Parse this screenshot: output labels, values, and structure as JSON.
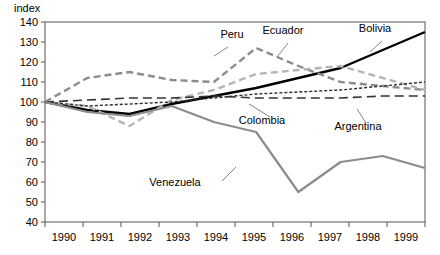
{
  "chart_data": {
    "type": "line",
    "title": "",
    "ylabel": "index",
    "xlabel": "",
    "categories": [
      "1990",
      "1991",
      "1992",
      "1993",
      "1994",
      "1995",
      "1996",
      "1997",
      "1998",
      "1999"
    ],
    "x": [
      1990,
      1991,
      1992,
      1993,
      1994,
      1995,
      1996,
      1997,
      1998,
      1999
    ],
    "ylim": [
      40,
      140
    ],
    "yticks": [
      "40",
      "50",
      "60",
      "70",
      "80",
      "90",
      "100",
      "110",
      "120",
      "130",
      "140"
    ],
    "grid": false,
    "legend": "inline-annotations",
    "series": [
      {
        "name": "Bolivia",
        "style": "solid",
        "color": "#000000",
        "values": [
          100,
          96,
          94,
          99,
          103,
          107,
          112,
          117,
          126,
          135
        ]
      },
      {
        "name": "Peru",
        "style": "dashed",
        "color": "#8c8c8c",
        "values": [
          100,
          112,
          115,
          111,
          110,
          127,
          118,
          110,
          108,
          106
        ]
      },
      {
        "name": "Ecuador",
        "style": "dashed",
        "color": "#b5b5b5",
        "values": [
          100,
          98,
          88,
          101,
          106,
          114,
          116,
          118,
          112,
          106
        ]
      },
      {
        "name": "Colombia",
        "style": "dotted",
        "color": "#2b2b2b",
        "values": [
          100,
          98,
          99,
          100,
          102,
          104,
          105,
          106,
          108,
          110
        ]
      },
      {
        "name": "Argentina",
        "style": "long-dash",
        "color": "#333333",
        "values": [
          100,
          101,
          102,
          102,
          103,
          102,
          102,
          102,
          103,
          103
        ]
      },
      {
        "name": "Venezuela",
        "style": "solid",
        "color": "#8c8c8c",
        "values": [
          100,
          95,
          93,
          98,
          90,
          85,
          55,
          70,
          73,
          67
        ]
      }
    ],
    "annotations": [
      {
        "text": "Peru",
        "x": 232,
        "y": 38
      },
      {
        "text": "Ecuador",
        "x": 283,
        "y": 34
      },
      {
        "text": "Bolivia",
        "x": 375,
        "y": 32
      },
      {
        "text": "Colombia",
        "x": 262,
        "y": 124
      },
      {
        "text": "Argentina",
        "x": 358,
        "y": 130
      },
      {
        "text": "Venezuela",
        "x": 175,
        "y": 186
      }
    ]
  }
}
